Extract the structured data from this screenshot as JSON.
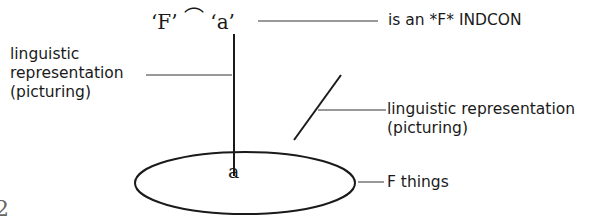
{
  "diagram": {
    "top_expression": {
      "F_quote": "‘F’",
      "concat_symbol": "⌒",
      "a_quote": "‘a’"
    },
    "labels": {
      "indcon": "is an *F* INDCON",
      "left_rep_line1": "linguistic",
      "left_rep_line2": "representation",
      "left_rep_line3": "(picturing)",
      "right_rep_line1": "linguistic representation",
      "right_rep_line2": "(picturing)",
      "f_things": "F things",
      "a_element": "a",
      "page_fragment": "2"
    },
    "colors": {
      "ink": "#1a1a1a",
      "background": "#ffffff"
    }
  }
}
